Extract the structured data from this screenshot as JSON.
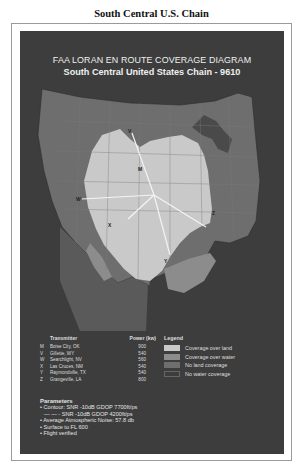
{
  "page": {
    "title": "South Central U.S. Chain"
  },
  "diagram": {
    "title": "FAA LORAN EN ROUTE  COVERAGE DIAGRAM",
    "subtitle": "South Central United States Chain - 9610",
    "colors": {
      "background": "#3d3d3d",
      "outside": "#4a4a4a",
      "no_land": "#6e6e6e",
      "land_coverage": "#c9c9c9",
      "water_coverage": "#8c8c8c",
      "lines": "#f4f4f4"
    },
    "station_labels": [
      "M",
      "V",
      "W",
      "X",
      "Y",
      "Z"
    ]
  },
  "transmitters": {
    "header_name": "Transmitter",
    "header_power": "Power (kw)",
    "rows": [
      {
        "id": "M",
        "name": "Boise City, OK",
        "power": "900"
      },
      {
        "id": "V",
        "name": "Gillette, WY",
        "power": "540"
      },
      {
        "id": "W",
        "name": "Searchlight, NV",
        "power": "560"
      },
      {
        "id": "X",
        "name": "Las Cruces, NM",
        "power": "540"
      },
      {
        "id": "Y",
        "name": "Raymondville, TX",
        "power": "540"
      },
      {
        "id": "Z",
        "name": "Grangeville, LA",
        "power": "800"
      }
    ]
  },
  "legend": {
    "title": "Legend",
    "items": [
      {
        "label": "Coverage over land",
        "color": "#c9c9c9"
      },
      {
        "label": "Coverage over water",
        "color": "#8c8c8c"
      },
      {
        "label": "No land coverage",
        "color": "#6e6e6e"
      },
      {
        "label": "No water coverage",
        "color": "#3d3d3d"
      }
    ]
  },
  "parameters": {
    "title": "Parameters",
    "items": [
      "• Contour: SNR -10dB GDOP 7700ft/ps",
      "  — — - SNR -10dB GDOP 4200ft/ps",
      "• Average Atmospheric Noise: 57.8 db",
      "• Surface to FL 600",
      "• Flight verified"
    ]
  }
}
